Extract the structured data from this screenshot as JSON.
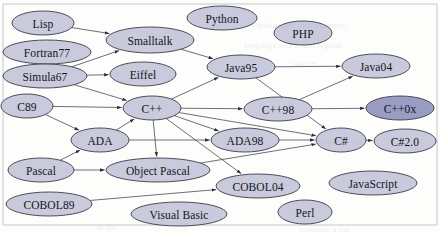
{
  "diagram": {
    "background_color": "#fdfdfb",
    "node_fill_light": "#c9cbdd",
    "node_fill_dark": "#9a9cc4",
    "node_stroke": "#3a3a4a",
    "edge_color": "#55555f",
    "frame_color": "#b9b9c2",
    "nodes": [
      {
        "id": "lisp",
        "label": "Lisp",
        "cx": 43,
        "cy": 23,
        "rx": 31,
        "ry": 12,
        "shade": "light"
      },
      {
        "id": "fortran77",
        "label": "Fortran77",
        "cx": 47,
        "cy": 52,
        "rx": 44,
        "ry": 12,
        "shade": "light"
      },
      {
        "id": "simula67",
        "label": "Simula67",
        "cx": 45,
        "cy": 76,
        "rx": 42,
        "ry": 12,
        "shade": "light"
      },
      {
        "id": "c89",
        "label": "C89",
        "cx": 27,
        "cy": 106,
        "rx": 26,
        "ry": 12,
        "shade": "light"
      },
      {
        "id": "smalltalk",
        "label": "Smalltalk",
        "cx": 150,
        "cy": 40,
        "rx": 44,
        "ry": 13,
        "shade": "light"
      },
      {
        "id": "eiffel",
        "label": "Eiffel",
        "cx": 143,
        "cy": 74,
        "rx": 33,
        "ry": 12,
        "shade": "light"
      },
      {
        "id": "cpp",
        "label": "C++",
        "cx": 152,
        "cy": 108,
        "rx": 29,
        "ry": 12,
        "shade": "light"
      },
      {
        "id": "ada",
        "label": "ADA",
        "cx": 100,
        "cy": 140,
        "rx": 29,
        "ry": 12,
        "shade": "light"
      },
      {
        "id": "pascal",
        "label": "Pascal",
        "cx": 41,
        "cy": 170,
        "rx": 33,
        "ry": 12,
        "shade": "light"
      },
      {
        "id": "cobol89",
        "label": "COBOL89",
        "cx": 49,
        "cy": 204,
        "rx": 43,
        "ry": 12,
        "shade": "light"
      },
      {
        "id": "objectpascal",
        "label": "Object Pascal",
        "cx": 158,
        "cy": 170,
        "rx": 52,
        "ry": 12,
        "shade": "light"
      },
      {
        "id": "visualbasic",
        "label": "Visual Basic",
        "cx": 179,
        "cy": 214,
        "rx": 48,
        "ry": 12,
        "shade": "light"
      },
      {
        "id": "python",
        "label": "Python",
        "cx": 222,
        "cy": 18,
        "rx": 35,
        "ry": 12,
        "shade": "light"
      },
      {
        "id": "php",
        "label": "PHP",
        "cx": 303,
        "cy": 33,
        "rx": 29,
        "ry": 12,
        "shade": "light"
      },
      {
        "id": "java95",
        "label": "Java95",
        "cx": 241,
        "cy": 67,
        "rx": 34,
        "ry": 12,
        "shade": "light"
      },
      {
        "id": "cpp98",
        "label": "C++98",
        "cx": 278,
        "cy": 109,
        "rx": 34,
        "ry": 12,
        "shade": "light"
      },
      {
        "id": "ada98",
        "label": "ADA98",
        "cx": 245,
        "cy": 140,
        "rx": 34,
        "ry": 12,
        "shade": "light"
      },
      {
        "id": "cobol04",
        "label": "COBOL04",
        "cx": 258,
        "cy": 186,
        "rx": 42,
        "ry": 12,
        "shade": "light"
      },
      {
        "id": "perl",
        "label": "Perl",
        "cx": 305,
        "cy": 212,
        "rx": 27,
        "ry": 12,
        "shade": "light"
      },
      {
        "id": "java04",
        "label": "Java04",
        "cx": 376,
        "cy": 66,
        "rx": 34,
        "ry": 12,
        "shade": "light"
      },
      {
        "id": "cpp0x",
        "label": "C++0x",
        "cx": 400,
        "cy": 108,
        "rx": 34,
        "ry": 12,
        "shade": "dark"
      },
      {
        "id": "csharp",
        "label": "C#",
        "cx": 341,
        "cy": 140,
        "rx": 25,
        "ry": 12,
        "shade": "light"
      },
      {
        "id": "csharp20",
        "label": "C#2.0",
        "cx": 405,
        "cy": 141,
        "rx": 31,
        "ry": 12,
        "shade": "light"
      },
      {
        "id": "javascript",
        "label": "JavaScript",
        "cx": 373,
        "cy": 183,
        "rx": 44,
        "ry": 12,
        "shade": "light"
      }
    ],
    "edges": [
      {
        "from": "lisp",
        "to": "smalltalk"
      },
      {
        "from": "simula67",
        "to": "smalltalk"
      },
      {
        "from": "simula67",
        "to": "eiffel"
      },
      {
        "from": "simula67",
        "to": "cpp"
      },
      {
        "from": "c89",
        "to": "cpp"
      },
      {
        "from": "c89",
        "to": "ada"
      },
      {
        "from": "smalltalk",
        "to": "java95"
      },
      {
        "from": "cpp",
        "to": "java95"
      },
      {
        "from": "cpp",
        "to": "cpp98"
      },
      {
        "from": "cpp",
        "to": "ada98"
      },
      {
        "from": "cpp",
        "to": "csharp"
      },
      {
        "from": "cpp",
        "to": "cobol04"
      },
      {
        "from": "cpp",
        "to": "objectpascal"
      },
      {
        "from": "ada",
        "to": "cpp"
      },
      {
        "from": "ada",
        "to": "ada98"
      },
      {
        "from": "pascal",
        "to": "objectpascal"
      },
      {
        "from": "pascal",
        "to": "ada"
      },
      {
        "from": "cobol89",
        "to": "cobol04"
      },
      {
        "from": "java95",
        "to": "java04"
      },
      {
        "from": "java95",
        "to": "csharp"
      },
      {
        "from": "cpp98",
        "to": "cpp0x"
      },
      {
        "from": "cpp98",
        "to": "java04"
      },
      {
        "from": "ada98",
        "to": "csharp"
      },
      {
        "from": "csharp",
        "to": "csharp20"
      },
      {
        "from": "objectpascal",
        "to": "csharp"
      }
    ],
    "frame": {
      "top_y": 4,
      "bottom_y": 225,
      "left_x": 3,
      "right_x": 437
    },
    "bleed_through": [
      {
        "text": "transformed into a generic",
        "x": 252,
        "y": 20
      },
      {
        "text": "language and 2 into regular",
        "x": 244,
        "y": 40
      },
      {
        "text": "source",
        "x": 292,
        "y": 58
      },
      {
        "text": "or the given",
        "x": 318,
        "y": 136
      },
      {
        "text": "in the",
        "x": 96,
        "y": 222
      },
      {
        "text": "contains a list",
        "x": 300,
        "y": 224
      }
    ]
  }
}
